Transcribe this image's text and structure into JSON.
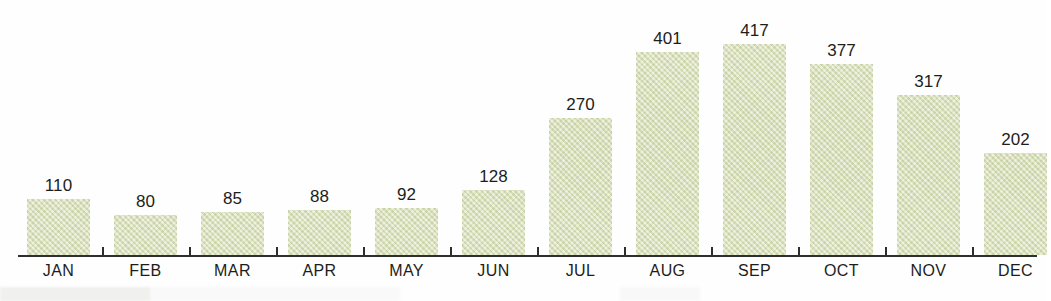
{
  "chart_data": {
    "type": "bar",
    "title": "",
    "subtitle": "",
    "xlabel": "",
    "ylabel": "",
    "categories": [
      "JAN",
      "FEB",
      "MAR",
      "APR",
      "MAY",
      "JUN",
      "JUL",
      "AUG",
      "SEP",
      "OCT",
      "NOV",
      "DEC"
    ],
    "values": [
      110,
      80,
      85,
      88,
      92,
      128,
      270,
      401,
      417,
      377,
      317,
      202
    ],
    "value_labels": [
      "110",
      "80",
      "85",
      "88",
      "92",
      "128",
      "270",
      "401",
      "417",
      "377",
      "317",
      "202"
    ],
    "ylim": [
      0,
      417
    ],
    "grid": false,
    "legend": null,
    "axis_visible": {
      "x": true,
      "y": false
    },
    "data_labels_shown": true,
    "colors": {
      "bar_fill": "#d9e0b9",
      "bar_texture": "#abb685",
      "axis": "#2e2e2c",
      "text": "#1d1d1b",
      "background": "#fefefe"
    }
  },
  "layout": {
    "axis": {
      "x": 18,
      "y": 255,
      "width": 1019,
      "thickness": 2
    },
    "bar_width": 63,
    "bar_pitch": 87,
    "first_bar_left": 27,
    "baseline_y": 255,
    "px_per_unit": 0.506
  }
}
